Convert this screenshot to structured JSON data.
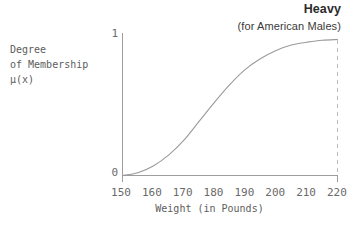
{
  "chart_data": {
    "type": "line",
    "title": "Heavy",
    "subtitle": "(for American Males)",
    "xlabel": "Weight (in Pounds)",
    "ylabel": "Degree of Membership μ(x)",
    "ylabel_lines": [
      "Degree",
      "of Membership",
      "μ(x)"
    ],
    "xlim": [
      150,
      220
    ],
    "ylim": [
      0,
      1
    ],
    "grid": false,
    "legend": null,
    "xticks": [
      150,
      160,
      170,
      180,
      190,
      200,
      210,
      220
    ],
    "xtick_labels": [
      "150",
      "160",
      "170",
      "180",
      "190",
      "200",
      "210",
      "220"
    ],
    "yticks": [
      0,
      1
    ],
    "ytick_labels": [
      "0",
      "1"
    ],
    "series": [
      {
        "name": "Heavy membership function",
        "x": [
          150,
          155,
          160,
          165,
          170,
          175,
          180,
          185,
          190,
          195,
          200,
          205,
          210,
          215,
          220
        ],
        "values": [
          0.0,
          0.02,
          0.07,
          0.15,
          0.26,
          0.4,
          0.54,
          0.67,
          0.78,
          0.86,
          0.92,
          0.96,
          0.98,
          0.995,
          1.0
        ]
      }
    ],
    "annotations": [
      {
        "name": "right-boundary-dashed-line",
        "x": 220,
        "style": "dashed-vertical"
      }
    ],
    "colors": {
      "curve": "#9a9a9a",
      "axis": "#9d9d9d",
      "dashed": "#bcbcbc",
      "text": "#5d5d5d",
      "title": "#2b2b2b",
      "background": "#ffffff"
    }
  }
}
